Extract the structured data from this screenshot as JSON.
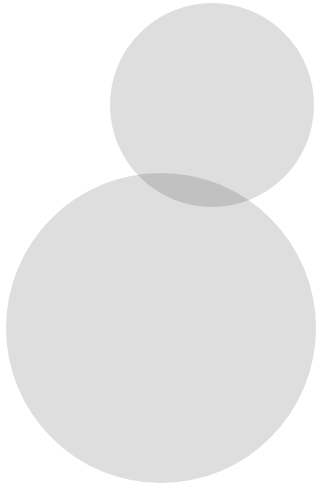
{
  "figure": {
    "name": "two-overlapping-circles",
    "width": 325,
    "height": 504,
    "background_color": "#ffffff",
    "blend_mode": "multiply",
    "overlap_color": "#c2c2c2",
    "shapes": [
      {
        "id": "upper-circle",
        "label": "Upper circle",
        "type": "circle",
        "cx": 212,
        "cy": 105,
        "r": 102,
        "fill": "#dedede",
        "opacity": 1
      },
      {
        "id": "lower-circle",
        "label": "Lower circle",
        "type": "circle",
        "cx": 161,
        "cy": 328,
        "r": 155,
        "fill": "#dedede",
        "opacity": 1
      }
    ]
  }
}
